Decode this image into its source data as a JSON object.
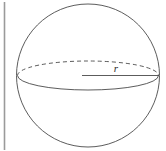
{
  "figure": {
    "kind": "geometry-diagram",
    "width": 166,
    "height": 151,
    "background_color": "#ffffff",
    "stroke_color": "#4a4a4a",
    "axis_color": "#9a9a9a",
    "label_color": "#2b2b2b",
    "labels": {
      "radius": "r"
    },
    "elements": {
      "vertical_axis_line": {
        "x": 4.5,
        "y_top": 2,
        "y_bottom": 150,
        "stroke_width": 1.6
      },
      "sphere_outline": {
        "cx": 88,
        "cy": 75.5,
        "r": 71.5,
        "stroke_width": 0.9
      },
      "equator_ellipse": {
        "cx": 88,
        "cy": 75.5,
        "rx": 70.5,
        "ry": 14.5,
        "front_style": "solid",
        "back_style": "dashed",
        "dash_pattern": "4 3",
        "stroke_width": 0.9
      },
      "radius_segment": {
        "x1": 82,
        "y1": 75.5,
        "x2": 159,
        "y2": 75.5,
        "stroke_width": 0.9
      },
      "radius_label": {
        "text": "r",
        "x": 116,
        "y": 72
      }
    }
  }
}
